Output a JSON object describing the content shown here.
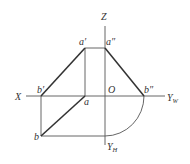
{
  "diagram": {
    "type": "orthographic-projection",
    "colors": {
      "line": "#333333",
      "thin": "#555555",
      "background": "#ffffff"
    },
    "axes": {
      "z": {
        "label": "Z"
      },
      "x": {
        "label": "X"
      },
      "yw": {
        "label": "Y",
        "subscript": "W"
      },
      "yh": {
        "label": "Y",
        "subscript": "H"
      },
      "origin": {
        "label": "O"
      }
    },
    "points": {
      "a_prime": {
        "label": "a′"
      },
      "a_double_prime": {
        "label": "a″"
      },
      "b_prime": {
        "label": "b′"
      },
      "b_double_prime": {
        "label": "b″"
      },
      "a": {
        "label": "a"
      },
      "b": {
        "label": "b"
      }
    }
  }
}
